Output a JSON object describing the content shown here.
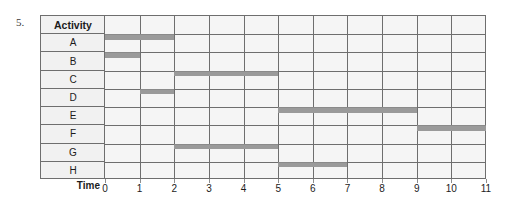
{
  "question_number": "5.",
  "table": {
    "header_label": "Activity",
    "axis_label": "Time"
  },
  "chart_data": {
    "type": "bar",
    "title": "",
    "xlabel": "Time",
    "ylabel": "Activity",
    "xlim": [
      0,
      11
    ],
    "grid": true,
    "legend": "none",
    "orientation": "horizontal",
    "tick_labels": [
      "0",
      "1",
      "2",
      "3",
      "4",
      "5",
      "6",
      "7",
      "8",
      "9",
      "10",
      "11"
    ],
    "categories": [
      "A",
      "B",
      "C",
      "D",
      "E",
      "F",
      "G",
      "H"
    ],
    "tasks": [
      {
        "activity": "A",
        "start": 0,
        "end": 2,
        "duration": 2
      },
      {
        "activity": "B",
        "start": 0,
        "end": 1,
        "duration": 1
      },
      {
        "activity": "C",
        "start": 2,
        "end": 5,
        "duration": 3
      },
      {
        "activity": "D",
        "start": 1,
        "end": 2,
        "duration": 1
      },
      {
        "activity": "E",
        "start": 5,
        "end": 9,
        "duration": 4
      },
      {
        "activity": "F",
        "start": 9,
        "end": 11,
        "duration": 2
      },
      {
        "activity": "G",
        "start": 2,
        "end": 5,
        "duration": 3
      },
      {
        "activity": "H",
        "start": 5,
        "end": 7,
        "duration": 2
      }
    ],
    "colors": {
      "bar": "#9a9a9a",
      "grid": "#6e6e6e",
      "cell_background": "#f5f5f5",
      "label_background": "#f1f1f1",
      "text": "#1c1c1c"
    }
  }
}
